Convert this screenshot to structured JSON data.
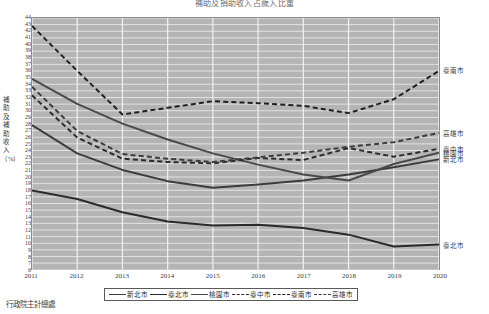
{
  "footer": {
    "source": "行政院主計總處"
  },
  "chart_data": {
    "type": "line",
    "title": "補助及捐助收入占歲入比重",
    "xlabel": "",
    "ylabel": "補助及補助收入（%）",
    "grid": true,
    "legend_position": "bottom",
    "xlim": [
      2011,
      2020
    ],
    "ylim": [
      6,
      44
    ],
    "ytick_step": 1,
    "categories": [
      "2011",
      "2012",
      "2013",
      "2014",
      "2015",
      "2016",
      "2017",
      "2018",
      "2019",
      "2020"
    ],
    "x": [
      2011,
      2012,
      2013,
      2014,
      2015,
      2016,
      2017,
      2018,
      2019,
      2020
    ],
    "yticks": [
      44,
      43,
      42,
      41,
      40,
      39,
      38,
      37,
      36,
      35,
      34,
      33,
      32,
      31,
      30,
      29,
      28,
      27,
      26,
      25,
      24,
      23,
      22,
      21,
      20,
      19,
      18,
      17,
      16,
      15,
      14,
      13,
      12,
      11,
      10,
      9,
      8,
      7,
      6
    ],
    "series": [
      {
        "name": "新北市",
        "style": "solid",
        "color": "#3c3c3c",
        "end_label": "新北市",
        "values": [
          27.8,
          23.5,
          21.0,
          19.3,
          18.3,
          18.8,
          19.4,
          20.3,
          21.4,
          22.6
        ]
      },
      {
        "name": "臺北市",
        "style": "solid",
        "color": "#2b2b2b",
        "end_label": "臺北市",
        "values": [
          17.9,
          16.6,
          14.6,
          13.2,
          12.6,
          12.7,
          12.2,
          11.2,
          9.4,
          9.7
        ]
      },
      {
        "name": "桃園市",
        "style": "solid",
        "color": "#4a4a4a",
        "end_label": "桃園市",
        "values": [
          34.8,
          31.0,
          28.0,
          25.6,
          23.5,
          21.8,
          20.3,
          19.4,
          21.9,
          23.6
        ]
      },
      {
        "name": "臺中市",
        "style": "dashed",
        "color": "#2b2b2b",
        "end_label": "臺中市",
        "values": [
          32.3,
          25.9,
          22.7,
          22.2,
          22.0,
          22.8,
          22.5,
          24.3,
          23.0,
          24.2
        ]
      },
      {
        "name": "臺南市",
        "style": "dashed",
        "color": "#1f1f1f",
        "end_label": "臺南市",
        "values": [
          42.8,
          36.0,
          29.4,
          30.4,
          31.4,
          31.1,
          30.7,
          29.6,
          31.7,
          36.0
        ]
      },
      {
        "name": "高雄市",
        "style": "dashed",
        "color": "#3c3c3c",
        "end_label": "高雄市",
        "values": [
          33.6,
          26.9,
          23.4,
          22.7,
          22.2,
          22.9,
          23.6,
          24.5,
          25.2,
          26.6
        ]
      }
    ]
  }
}
